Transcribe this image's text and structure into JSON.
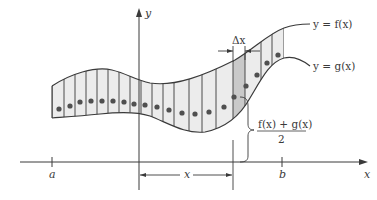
{
  "diagram": {
    "axes": {
      "x_label": "x",
      "y_label": "y",
      "ticks": [
        {
          "label": "a"
        },
        {
          "label": "b"
        }
      ]
    },
    "curves": {
      "upper_label": "y = f(x)",
      "lower_label": "y = g(x)"
    },
    "annotations": {
      "strip_width_label": "Δx",
      "distance_label": "x",
      "midpoint_numerator": "f(x) + g(x)",
      "midpoint_denominator": "2"
    },
    "strips": {
      "count": 20,
      "highlighted_index": 15
    },
    "colors": {
      "line": "#3a3a3a",
      "region_fill": "#ececec",
      "highlight_fill": "#c9c9c9",
      "dot": "#505050"
    }
  }
}
